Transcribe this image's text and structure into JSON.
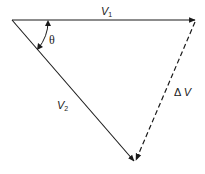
{
  "diagram": {
    "type": "vector-triangle",
    "labels": {
      "v1": {
        "main": "V",
        "sub": "1"
      },
      "v2": {
        "main": "V",
        "sub": "2"
      },
      "angle": "θ",
      "delta_v": {
        "symbol": "Δ",
        "main": "V"
      }
    },
    "vertices": {
      "origin": [
        12,
        20
      ],
      "v1_tip": [
        196,
        20
      ],
      "v2_tip": [
        135,
        162
      ]
    },
    "colors": {
      "stroke": "#1a1a1a",
      "background": "#ffffff"
    },
    "edges": [
      {
        "name": "v1",
        "from": "origin",
        "to": "v1_tip",
        "style": "solid",
        "arrow": true
      },
      {
        "name": "v2",
        "from": "origin",
        "to": "v2_tip",
        "style": "solid",
        "arrow": true
      },
      {
        "name": "delta_v",
        "from": "v1_tip",
        "to": "v2_tip",
        "style": "dashed",
        "arrow": true
      }
    ]
  }
}
